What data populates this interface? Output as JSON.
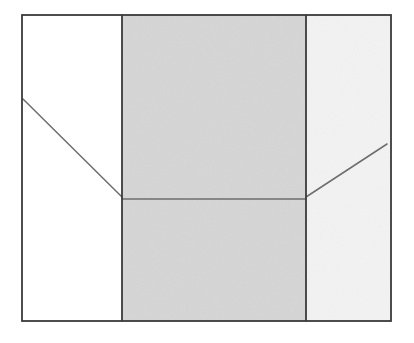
{
  "diagram": {
    "colors": {
      "background": "#ffffff",
      "border": "#3a3a3a",
      "left_panel": "#ffffff",
      "center_panel": "#d6d6d6",
      "right_panel": "#f3f3f3",
      "inner_line": "#6e6e6e"
    },
    "outer_box": {
      "x": 22,
      "y": 15,
      "width": 369,
      "height": 306
    },
    "panels": [
      {
        "name": "left",
        "x": 22,
        "width": 100,
        "fill": "#ffffff"
      },
      {
        "name": "center",
        "x": 122,
        "width": 184,
        "fill": "#d6d6d6"
      },
      {
        "name": "right",
        "x": 306,
        "width": 85,
        "fill": "#f3f3f3"
      }
    ],
    "lines": [
      {
        "name": "left-diagonal",
        "x1": 23,
        "y1": 99,
        "x2": 122,
        "y2": 197
      },
      {
        "name": "center-horizontal",
        "x1": 122,
        "y1": 199,
        "x2": 306,
        "y2": 199
      },
      {
        "name": "right-diagonal",
        "x1": 306,
        "y1": 197,
        "x2": 387,
        "y2": 144
      }
    ]
  }
}
